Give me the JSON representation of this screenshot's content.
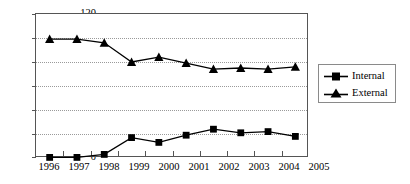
{
  "chart_data": {
    "type": "line",
    "title": "",
    "xlabel": "",
    "ylabel": "",
    "categories": [
      "1996",
      "1997",
      "1998",
      "1999",
      "2000",
      "2001",
      "2002",
      "2003",
      "2004",
      "2005"
    ],
    "series": [
      {
        "name": "Internal",
        "marker": "square",
        "values": [
          0.5,
          0.5,
          3,
          17,
          13,
          19,
          24,
          21,
          22,
          18
        ]
      },
      {
        "name": "External",
        "marker": "triangle",
        "values": [
          99,
          99,
          96,
          80,
          84,
          79,
          74,
          75,
          74,
          76
        ]
      }
    ],
    "ylim": [
      0,
      120
    ],
    "yticks": [
      0,
      20,
      40,
      60,
      80,
      100,
      120
    ],
    "ytick_labels": [
      "0",
      "20",
      "40",
      "60",
      "80",
      "100",
      "120"
    ],
    "grid": true,
    "grid_axis": "y",
    "legend_position": "right",
    "line_color": "#000000",
    "grid_color": "#9a9a9a",
    "axis_color": "#555555"
  },
  "legend": {
    "items": [
      {
        "label": "Internal",
        "marker": "square-marker"
      },
      {
        "label": "External",
        "marker": "triangle-marker"
      }
    ]
  }
}
